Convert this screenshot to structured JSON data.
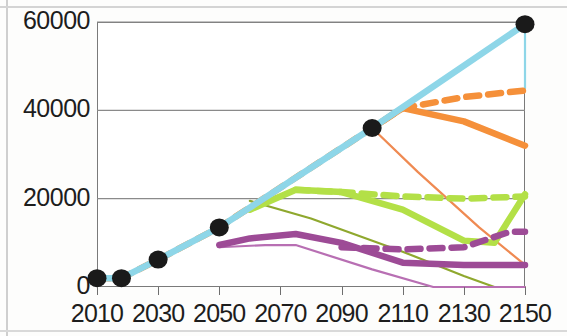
{
  "chart_data": {
    "type": "line",
    "title": "",
    "unit_label": "TWh",
    "xlabel": "",
    "ylabel": "TWh",
    "xlim": [
      2010,
      2150
    ],
    "ylim": [
      0,
      60000
    ],
    "x_ticks": [
      2010,
      2030,
      2050,
      2070,
      2090,
      2110,
      2130,
      2150
    ],
    "y_ticks": [
      0,
      20000,
      40000,
      60000
    ],
    "grid": "horizontal",
    "legend_position": "none",
    "colors": {
      "total_lightblue": "#8ed6e8",
      "total_orange": "#f5903a",
      "orange_thick": "#f5903a",
      "orange_thin": "#ef8a52",
      "green_light": "#b3e047",
      "green_dark": "#8fa82e",
      "purple": "#9d4b96",
      "purple_thin": "#b86fb3",
      "marker_black": "#1a1a1a"
    },
    "markers": {
      "name": "Historical / benchmark points",
      "color": "#1a1a1a",
      "points": [
        {
          "x": 2010,
          "y": 2000
        },
        {
          "x": 2018,
          "y": 2000
        },
        {
          "x": 2030,
          "y": 6200
        },
        {
          "x": 2050,
          "y": 13500
        },
        {
          "x": 2100,
          "y": 36000
        },
        {
          "x": 2150,
          "y": 59500
        }
      ]
    },
    "series": [
      {
        "name": "Total demand (light blue, thick)",
        "color": "#8ed6e8",
        "style": "solid-thick",
        "x": [
          2010,
          2018,
          2030,
          2050,
          2100,
          2150
        ],
        "values": [
          2000,
          2000,
          6200,
          13500,
          36000,
          59500
        ]
      },
      {
        "name": "Total demand (orange dashed overlay)",
        "color": "#f5903a",
        "style": "dashed-thick",
        "x": [
          2010,
          2018,
          2030,
          2050,
          2100,
          2110,
          2130,
          2150
        ],
        "values": [
          2000,
          2000,
          6200,
          13500,
          36000,
          40500,
          43000,
          44500
        ]
      },
      {
        "name": "Total demand (light blue thin, upper branch)",
        "color": "#8ed6e8",
        "style": "solid-thin",
        "x": [
          2150,
          2150
        ],
        "values": [
          59500,
          45000
        ]
      },
      {
        "name": "Orange thick solid",
        "color": "#f5903a",
        "style": "solid-thick",
        "x": [
          2100,
          2110,
          2130,
          2150
        ],
        "values": [
          36000,
          40500,
          37500,
          32000
        ]
      },
      {
        "name": "Orange thin",
        "color": "#ef8a52",
        "style": "solid-thin",
        "x": [
          2100,
          2115,
          2135,
          2150
        ],
        "values": [
          36000,
          26000,
          13500,
          5000
        ]
      },
      {
        "name": "Light green thick solid",
        "color": "#b3e047",
        "style": "solid-thick",
        "x": [
          2060,
          2075,
          2090,
          2110,
          2130,
          2140,
          2150
        ],
        "values": [
          17500,
          22000,
          21500,
          17500,
          10500,
          10000,
          21000
        ]
      },
      {
        "name": "Light green dashed",
        "color": "#b3e047",
        "style": "dashed-thick",
        "x": [
          2075,
          2090,
          2110,
          2130,
          2150
        ],
        "values": [
          22000,
          21500,
          20500,
          20000,
          20500
        ]
      },
      {
        "name": "Dark green (olive) thin",
        "color": "#8fa82e",
        "style": "solid-thin",
        "x": [
          2060,
          2080,
          2110,
          2130,
          2140,
          2150
        ],
        "values": [
          19500,
          15500,
          8000,
          2500,
          0,
          0
        ]
      },
      {
        "name": "Purple thick solid",
        "color": "#9d4b96",
        "style": "solid-thick",
        "x": [
          2050,
          2060,
          2075,
          2090,
          2110,
          2130,
          2150
        ],
        "values": [
          9500,
          11000,
          12000,
          10000,
          5500,
          5000,
          5000
        ]
      },
      {
        "name": "Purple dashed",
        "color": "#9d4b96",
        "style": "dashed-thick",
        "x": [
          2090,
          2110,
          2130,
          2145,
          2150
        ],
        "values": [
          9000,
          8500,
          9000,
          12500,
          12500
        ]
      },
      {
        "name": "Purple thin",
        "color": "#b86fb3",
        "style": "solid-thin",
        "x": [
          2050,
          2065,
          2075,
          2100,
          2120,
          2150
        ],
        "values": [
          9000,
          9500,
          9500,
          4000,
          0,
          0
        ]
      }
    ]
  },
  "axes": {
    "y_tick_labels": [
      "60000",
      "40000",
      "20000",
      "0"
    ],
    "x_tick_labels": [
      "2010",
      "2030",
      "2050",
      "2070",
      "2090",
      "2110",
      "2130",
      "2150"
    ]
  }
}
